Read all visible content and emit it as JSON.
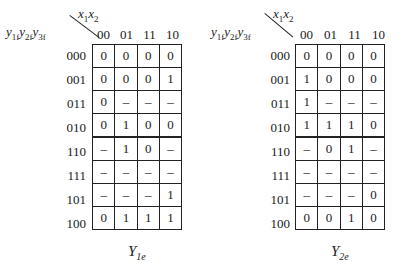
{
  "maps": [
    {
      "name": "Y1e",
      "title_main": "Y",
      "title_sub": "1e",
      "col_var_label": "x1x2",
      "row_var_label": "y1f y2f y3f",
      "columns": [
        "00",
        "01",
        "11",
        "10"
      ],
      "rows": [
        "000",
        "001",
        "011",
        "010",
        "110",
        "111",
        "101",
        "100"
      ],
      "cells": [
        [
          "0",
          "0",
          "0",
          "0"
        ],
        [
          "0",
          "0",
          "0",
          "1"
        ],
        [
          "0",
          "–",
          "–",
          "–"
        ],
        [
          "0",
          "1",
          "0",
          "0"
        ],
        [
          "–",
          "1",
          "0",
          "–"
        ],
        [
          "–",
          "–",
          "–",
          "–"
        ],
        [
          "–",
          "–",
          "–",
          "1"
        ],
        [
          "0",
          "1",
          "1",
          "1"
        ]
      ]
    },
    {
      "name": "Y2e",
      "title_main": "Y",
      "title_sub": "2e",
      "col_var_label": "x1x2",
      "row_var_label": "y1f y2f y3f",
      "columns": [
        "00",
        "01",
        "11",
        "10"
      ],
      "rows": [
        "000",
        "001",
        "011",
        "010",
        "110",
        "111",
        "101",
        "100"
      ],
      "cells": [
        [
          "0",
          "0",
          "0",
          "0"
        ],
        [
          "1",
          "0",
          "0",
          "0"
        ],
        [
          "1",
          "–",
          "–",
          "–"
        ],
        [
          "1",
          "1",
          "1",
          "0"
        ],
        [
          "–",
          "0",
          "1",
          "–"
        ],
        [
          "–",
          "–",
          "–",
          "–"
        ],
        [
          "–",
          "–",
          "–",
          "0"
        ],
        [
          "0",
          "0",
          "1",
          "0"
        ]
      ]
    }
  ]
}
